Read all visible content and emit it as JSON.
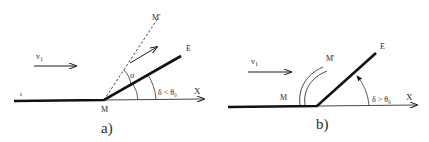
{
  "figure": {
    "background": "#ffffff",
    "ink_color": "#1a1a1a",
    "panels": [
      {
        "id": "a",
        "caption": "a)",
        "labels": {
          "velocity": "v",
          "velocity_sub": "1",
          "corner": "M",
          "mach_line": "M'",
          "end": "E",
          "axis": "X",
          "shock_angle": "σ",
          "deflection_condition": "δ < θ₀",
          "tick": "ı"
        },
        "elements": {
          "wall": "thick polyline from upstream wall to corner M then wedge up to E",
          "axis": "thin horizontal arrow X from M",
          "mach_line": "dashed line from M to M'",
          "flow_arrow": "arrow v1 pointing right",
          "deflected_flow_arrow": "arrow parallel to wedge",
          "arcs": [
            "angle σ between dashed line and wedge",
            "angle δ between X and wedge"
          ]
        }
      },
      {
        "id": "b",
        "caption": "b)",
        "labels": {
          "velocity": "v",
          "velocity_sub": "1",
          "corner": "M",
          "mach_line": "M'",
          "end": "E",
          "axis": "X",
          "deflection_condition": "δ > θ₀"
        },
        "elements": {
          "wall": "thick polyline from upstream wall to corner then steep wedge up to E",
          "axis": "thin horizontal arrow X from corner",
          "detached_shock": "two curved lines ahead of corner labeled M'",
          "flow_arrow": "arrow v1 pointing right",
          "arcs": [
            "angle δ between X and wedge with arrowhead"
          ]
        }
      }
    ]
  }
}
